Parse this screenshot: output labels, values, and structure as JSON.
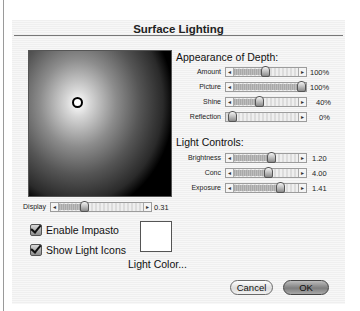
{
  "dialog": {
    "title": "Surface Lighting"
  },
  "preview": {
    "display_slider": {
      "label": "Display",
      "value": "0.31",
      "position": 0.31
    }
  },
  "appearance_of_depth": {
    "title": "Appearance of Depth:",
    "sliders": [
      {
        "label": "Amount",
        "value": "100%",
        "position": 0.5
      },
      {
        "label": "Picture",
        "value": "100%",
        "position": 1.0
      },
      {
        "label": "Shine",
        "value": "40%",
        "position": 0.4
      },
      {
        "label": "Reflection",
        "value": "0%",
        "position": 0.0
      }
    ]
  },
  "light_controls": {
    "title": "Light Controls:",
    "sliders": [
      {
        "label": "Brightness",
        "value": "1.20",
        "position": 0.6
      },
      {
        "label": "Conc",
        "value": "4.00",
        "position": 0.54
      },
      {
        "label": "Exposure",
        "value": "1.41",
        "position": 0.71
      }
    ]
  },
  "options": {
    "enable_impasto": {
      "label": "Enable Impasto",
      "checked": true
    },
    "show_light_icons": {
      "label": "Show Light Icons",
      "checked": true
    }
  },
  "light_color": {
    "label": "Light Color...",
    "swatch": "#ffffff"
  },
  "buttons": {
    "cancel": "Cancel",
    "ok": "OK"
  },
  "icons": {
    "left_arrow": "◂",
    "right_arrow": "▸"
  }
}
